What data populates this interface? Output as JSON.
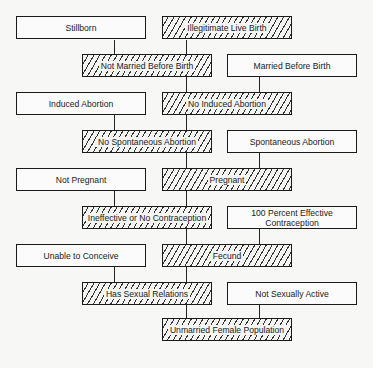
{
  "diagram": {
    "boxes": [
      {
        "id": "stillborn",
        "label": "Stillborn",
        "style": "plain"
      },
      {
        "id": "illegitimate-live-birth",
        "label": "Illegitimate Live Birth",
        "style": "hatched"
      },
      {
        "id": "not-married-before-birth",
        "label": "Not Married Before Birth",
        "style": "hatched"
      },
      {
        "id": "married-before-birth",
        "label": "Married Before Birth",
        "style": "plain"
      },
      {
        "id": "induced-abortion",
        "label": "Induced Abortion",
        "style": "plain"
      },
      {
        "id": "no-induced-abortion",
        "label": "No Induced Abortion",
        "style": "hatched"
      },
      {
        "id": "no-spontaneous-abortion",
        "label": "No Spontaneous Abortion",
        "style": "hatched"
      },
      {
        "id": "spontaneous-abortion",
        "label": "Spontaneous Abortion",
        "style": "plain"
      },
      {
        "id": "not-pregnant",
        "label": "Not Pregnant",
        "style": "plain"
      },
      {
        "id": "pregnant",
        "label": "Pregnant",
        "style": "hatched"
      },
      {
        "id": "ineffective-or-no-contraception",
        "label": "Ineffective or No Contraception",
        "style": "hatched"
      },
      {
        "id": "100-percent-effective-contraception",
        "label": "100 Percent Effective Contraception",
        "style": "plain"
      },
      {
        "id": "unable-to-conceive",
        "label": "Unable to Conceive",
        "style": "plain"
      },
      {
        "id": "fecund",
        "label": "Fecund",
        "style": "hatched"
      },
      {
        "id": "has-sexual-relations",
        "label": "Has Sexual Relations",
        "style": "hatched"
      },
      {
        "id": "not-sexually-active",
        "label": "Not Sexually Active",
        "style": "plain"
      },
      {
        "id": "unmarried-female-population",
        "label": "Unmarried Female Population",
        "style": "hatched"
      }
    ]
  }
}
